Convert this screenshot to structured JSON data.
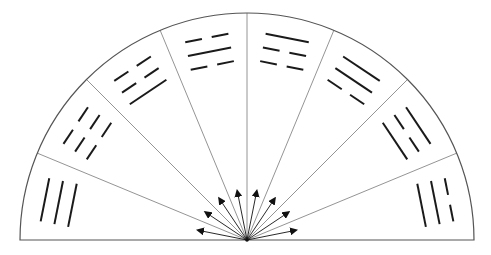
{
  "diagram": {
    "title": "",
    "colors": {
      "outline": "#555555",
      "divider": "#888888",
      "trigram_line": "#1a1a1a",
      "arrow": "#111111",
      "background": "#ffffff"
    },
    "geometry": {
      "center_x": 247,
      "center_y": 240,
      "radius": 227,
      "sector_count": 8,
      "sector_angle_deg": 22.5
    },
    "sectors": [
      {
        "index": 1,
        "mid_angle_deg": 168.75,
        "trigram": [
          "solid",
          "solid",
          "solid"
        ],
        "order": "inner-to-outer"
      },
      {
        "index": 2,
        "mid_angle_deg": 146.25,
        "trigram": [
          "broken",
          "broken",
          "broken"
        ],
        "order": "inner-to-outer"
      },
      {
        "index": 3,
        "mid_angle_deg": 123.75,
        "trigram": [
          "solid",
          "broken",
          "broken"
        ],
        "order": "inner-to-outer"
      },
      {
        "index": 4,
        "mid_angle_deg": 101.25,
        "trigram": [
          "broken",
          "solid",
          "broken"
        ],
        "order": "inner-to-outer"
      },
      {
        "index": 5,
        "mid_angle_deg": 78.75,
        "trigram": [
          "broken",
          "broken",
          "solid"
        ],
        "order": "inner-to-outer"
      },
      {
        "index": 6,
        "mid_angle_deg": 56.25,
        "trigram": [
          "broken",
          "solid",
          "solid"
        ],
        "order": "inner-to-outer"
      },
      {
        "index": 7,
        "mid_angle_deg": 33.75,
        "trigram": [
          "solid",
          "broken",
          "solid"
        ],
        "order": "inner-to-outer"
      },
      {
        "index": 8,
        "mid_angle_deg": 11.25,
        "trigram": [
          "solid",
          "solid",
          "broken"
        ],
        "order": "inner-to-outer"
      }
    ],
    "arrows": {
      "count": 8,
      "length": 50,
      "direction": "outward-from-center"
    }
  }
}
